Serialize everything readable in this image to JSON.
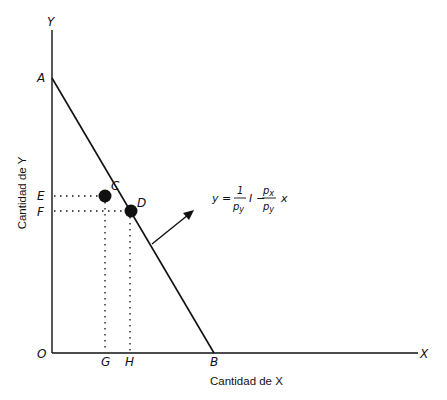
{
  "diagram": {
    "axes": {
      "y_axis_symbol": "Y",
      "x_axis_symbol": "X",
      "origin_label": "O",
      "y_axis_title": "Cantidad de Y",
      "x_axis_title": "Cantidad de X"
    },
    "points": {
      "A": "A",
      "B": "B",
      "C": "C",
      "D": "D",
      "E": "E",
      "F": "F",
      "G": "G",
      "H": "H"
    },
    "equation": {
      "lhs": "y =",
      "frac1_num": "1",
      "frac1_den_p": "p",
      "frac1_den_sub": "y",
      "income": "I",
      "minus": "−",
      "frac2_num_p": "p",
      "frac2_num_sub": "x",
      "frac2_den_p": "p",
      "frac2_den_sub": "y",
      "var": "x"
    },
    "colors": {
      "ink": "#111111",
      "background": "#ffffff"
    }
  }
}
